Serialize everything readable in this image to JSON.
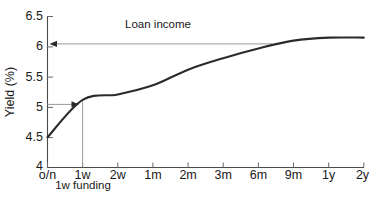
{
  "chart_data": {
    "type": "line",
    "title": "",
    "xlabel": "",
    "ylabel": "Yield (%)",
    "ylim": [
      4,
      6.5
    ],
    "grid": false,
    "legend": "none",
    "y_ticks": [
      "4",
      "4.5",
      "5",
      "5.5",
      "6",
      "6.5"
    ],
    "y_tick_values": [
      4,
      4.5,
      5,
      5.5,
      6,
      6.5
    ],
    "categories": [
      "o/n",
      "1w",
      "2w",
      "1m",
      "2m",
      "3m",
      "6m",
      "9m",
      "1y",
      "2y"
    ],
    "x_index": [
      0,
      1,
      2,
      3,
      4,
      5,
      6,
      7,
      8,
      9
    ],
    "series": [
      {
        "name": "Yield curve",
        "values": [
          4.5,
          5.12,
          5.21,
          5.36,
          5.62,
          5.81,
          5.97,
          6.1,
          6.15,
          6.15
        ]
      }
    ],
    "annotations": [
      {
        "name": "loan-income",
        "label": "Loan income",
        "y_value": 6.05,
        "x_from": "6m",
        "x_to": "o/n",
        "arrow_direction": "left"
      },
      {
        "name": "funding-cost",
        "label": "1w funding",
        "y_value": 5.05,
        "x_from": "o/n",
        "x_to": "1w",
        "arrow_direction": "right"
      }
    ]
  },
  "axis": {
    "y_title": "Yield (%)",
    "y_labels": [
      "6.5",
      "6",
      "5.5",
      "5",
      "4.5",
      "4"
    ],
    "x_labels": [
      "o/n",
      "1w",
      "2w",
      "1m",
      "2m",
      "3m",
      "6m",
      "9m",
      "1y",
      "2y"
    ]
  },
  "annotations": {
    "loan_income_label": "Loan income",
    "funding_label": "1w funding"
  },
  "colors": {
    "curve": "#2b2b2b",
    "axis": "#4a4a4a",
    "annotation": "#9a9a9a",
    "text": "#1a1a1a",
    "background": "#ffffff"
  }
}
